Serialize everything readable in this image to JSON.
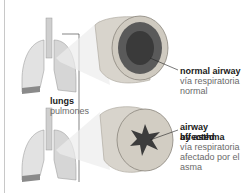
{
  "diagram": {
    "labels": {
      "lungs_en": "lungs",
      "lungs_es": "pulmones",
      "normal_en": "normal airway",
      "normal_es_1": "vía respiratoria",
      "normal_es_2": "normal",
      "asthma_en_1": "airway affected",
      "asthma_en_2": "by asthma",
      "asthma_es_1": "vía respiratoria",
      "asthma_es_2": "afectado por el",
      "asthma_es_3": "asma"
    },
    "colors": {
      "lung_fill": "#dcdcdc",
      "airway_outer": "#d8d4cc",
      "airway_lumen": "#5a5a5a",
      "asthma_lumen": "#3c3c3c",
      "label_text": "#1a1a1a",
      "spanish_text": "#6a6a6a"
    }
  }
}
